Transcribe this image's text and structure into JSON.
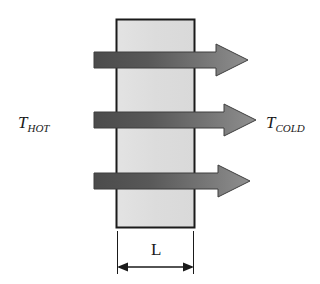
{
  "diagram": {
    "type": "heat-conduction-through-slab",
    "background_color": "#ffffff",
    "slab": {
      "name": "wall-slab",
      "fill_color": "#dedede",
      "stroke_color": "#1a1a1a",
      "x": 116,
      "y": 19,
      "width": 78,
      "height": 209
    },
    "labels": {
      "hot_side": {
        "main": "T",
        "subscript": "HOT",
        "x": 18,
        "y": 128
      },
      "cold_side": {
        "main": "T",
        "subscript": "COLD",
        "x": 266,
        "y": 128
      },
      "thickness": {
        "text": "L",
        "x": 155,
        "y": 254
      }
    },
    "heat_flow_arrows": {
      "count": 3,
      "direction": "left-to-right",
      "gradient_start_color": "#4f4f4f",
      "gradient_end_color": "#8c8c8c",
      "outline_color": "#3d3d3d",
      "items": [
        {
          "name": "heat-flow-arrow-top",
          "y_center": 60,
          "x_start": 94,
          "x_tip": 248,
          "shaft_half_height": 8,
          "head_half_height": 16,
          "head_length": 32
        },
        {
          "name": "heat-flow-arrow-middle",
          "y_center": 120,
          "x_start": 94,
          "x_tip": 256,
          "shaft_half_height": 8,
          "head_half_height": 16,
          "head_length": 32
        },
        {
          "name": "heat-flow-arrow-bottom",
          "y_center": 181,
          "x_start": 94,
          "x_tip": 250,
          "shaft_half_height": 8,
          "head_half_height": 16,
          "head_length": 32
        }
      ]
    },
    "dimension_line": {
      "name": "thickness-dimension",
      "y": 267,
      "x_left": 117,
      "x_right": 194,
      "extension_top": 231,
      "stroke_color": "#1a1a1a",
      "double_headed": true
    }
  }
}
